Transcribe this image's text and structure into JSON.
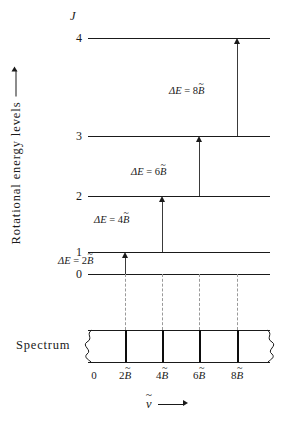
{
  "figure": {
    "axes": {
      "y_label": "Rotational energy levels",
      "y_axis_arrow": "up-arrow",
      "x_label_symbol": "v",
      "x_label_accent": "~",
      "x_axis_arrow": "right-arrow"
    },
    "quantum_number_header": "J",
    "spectrum_label": "Spectrum",
    "levels": [
      {
        "J": "4",
        "y": 38,
        "x1": 88,
        "x2": 270
      },
      {
        "J": "3",
        "y": 136,
        "x1": 88,
        "x2": 270
      },
      {
        "J": "2",
        "y": 196,
        "x1": 88,
        "x2": 270
      },
      {
        "J": "1",
        "y": 252,
        "x1": 88,
        "x2": 270
      },
      {
        "J": "0",
        "y": 274,
        "x1": 88,
        "x2": 270
      }
    ],
    "transitions": [
      {
        "label_delta": "ΔE",
        "label_eq": "=",
        "label_coeff": "2",
        "label_symbol": "B",
        "label_accent": "~",
        "x": 125,
        "from_y": 274,
        "to_y": 252
      },
      {
        "label_delta": "ΔE",
        "label_eq": "=",
        "label_coeff": "4",
        "label_symbol": "B",
        "label_accent": "~",
        "x": 162,
        "from_y": 252,
        "to_y": 196
      },
      {
        "label_delta": "ΔE",
        "label_eq": "=",
        "label_coeff": "6",
        "label_symbol": "B",
        "label_accent": "~",
        "x": 199,
        "from_y": 196,
        "to_y": 136
      },
      {
        "label_delta": "ΔE",
        "label_eq": "=",
        "label_coeff": "8",
        "label_symbol": "B",
        "label_accent": "~",
        "x": 237,
        "from_y": 136,
        "to_y": 38
      }
    ],
    "spectrum": {
      "box_left": 88,
      "box_right": 270,
      "box_top": 330,
      "box_bottom": 362,
      "lines_x": [
        125,
        162,
        199,
        237
      ]
    },
    "ticks": [
      {
        "x": 94,
        "coeff": "0",
        "symbol": "",
        "accent": ""
      },
      {
        "x": 125,
        "coeff": "2",
        "symbol": "B",
        "accent": "~"
      },
      {
        "x": 162,
        "coeff": "4",
        "symbol": "B",
        "accent": "~"
      },
      {
        "x": 199,
        "coeff": "6",
        "symbol": "B",
        "accent": "~"
      },
      {
        "x": 237,
        "coeff": "8",
        "symbol": "B",
        "accent": "~"
      }
    ]
  }
}
